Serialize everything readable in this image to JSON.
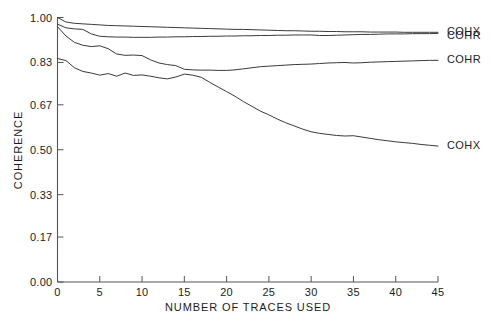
{
  "chart_data": {
    "type": "line",
    "title": "",
    "xlabel": "NUMBER OF TRACES USED",
    "ylabel": "COHERENCE",
    "xlim": [
      0,
      45
    ],
    "ylim": [
      0.0,
      1.0
    ],
    "grid": false,
    "legend_position": "right-inline",
    "xticks": [
      0,
      5,
      10,
      15,
      20,
      25,
      30,
      35,
      40,
      45
    ],
    "xticklabels": [
      "0",
      "5",
      "10",
      "15",
      "20",
      "25",
      "30",
      "35",
      "40",
      "45"
    ],
    "yticks": [
      0.0,
      0.17,
      0.33,
      0.5,
      0.67,
      0.83,
      1.0
    ],
    "yticklabels": [
      "0.00",
      "0.17",
      "0.33",
      "0.50",
      "0.67",
      "0.83",
      "1.00"
    ],
    "x": [
      0,
      1,
      2,
      3,
      4,
      5,
      6,
      7,
      8,
      9,
      10,
      11,
      12,
      13,
      14,
      15,
      16,
      17,
      18,
      19,
      20,
      21,
      22,
      23,
      24,
      25,
      26,
      27,
      28,
      29,
      30,
      31,
      32,
      33,
      34,
      35,
      36,
      37,
      38,
      39,
      40,
      41,
      42,
      43,
      44,
      45
    ],
    "series": [
      {
        "name": "COHX",
        "label": "COHX",
        "label_value": 0.945,
        "color": "#3a3a3a",
        "values": [
          1.0,
          0.983,
          0.978,
          0.976,
          0.974,
          0.972,
          0.97,
          0.969,
          0.968,
          0.967,
          0.966,
          0.965,
          0.964,
          0.963,
          0.962,
          0.961,
          0.96,
          0.959,
          0.958,
          0.957,
          0.956,
          0.955,
          0.955,
          0.954,
          0.953,
          0.952,
          0.951,
          0.95,
          0.95,
          0.949,
          0.948,
          0.948,
          0.947,
          0.947,
          0.946,
          0.946,
          0.946,
          0.945,
          0.945,
          0.945,
          0.945,
          0.944,
          0.944,
          0.944,
          0.944,
          0.944
        ]
      },
      {
        "name": "COHR",
        "label": "COHR",
        "label_value": 0.928,
        "color": "#3a3a3a",
        "values": [
          0.975,
          0.961,
          0.957,
          0.955,
          0.938,
          0.929,
          0.927,
          0.926,
          0.926,
          0.925,
          0.925,
          0.925,
          0.926,
          0.926,
          0.927,
          0.927,
          0.928,
          0.928,
          0.929,
          0.929,
          0.93,
          0.93,
          0.931,
          0.931,
          0.932,
          0.932,
          0.933,
          0.933,
          0.934,
          0.934,
          0.934,
          0.932,
          0.932,
          0.933,
          0.934,
          0.935,
          0.936,
          0.936,
          0.937,
          0.938,
          0.938,
          0.938,
          0.939,
          0.939,
          0.939,
          0.94
        ]
      },
      {
        "name": "COHR",
        "label": "COHR",
        "label_value": 0.838,
        "color": "#3a3a3a",
        "values": [
          0.965,
          0.93,
          0.906,
          0.895,
          0.89,
          0.893,
          0.882,
          0.862,
          0.857,
          0.858,
          0.856,
          0.84,
          0.828,
          0.822,
          0.818,
          0.804,
          0.802,
          0.801,
          0.801,
          0.8,
          0.8,
          0.802,
          0.806,
          0.81,
          0.814,
          0.816,
          0.818,
          0.82,
          0.822,
          0.823,
          0.824,
          0.826,
          0.828,
          0.829,
          0.83,
          0.828,
          0.829,
          0.831,
          0.832,
          0.833,
          0.834,
          0.835,
          0.836,
          0.837,
          0.838,
          0.838
        ]
      },
      {
        "name": "COHX",
        "label": "COHX",
        "label_value": 0.512,
        "color": "#3a3a3a",
        "values": [
          0.845,
          0.837,
          0.81,
          0.796,
          0.79,
          0.782,
          0.788,
          0.778,
          0.79,
          0.781,
          0.783,
          0.778,
          0.772,
          0.768,
          0.775,
          0.786,
          0.782,
          0.774,
          0.755,
          0.737,
          0.72,
          0.702,
          0.682,
          0.664,
          0.646,
          0.632,
          0.616,
          0.602,
          0.59,
          0.578,
          0.568,
          0.562,
          0.558,
          0.554,
          0.552,
          0.553,
          0.548,
          0.543,
          0.538,
          0.534,
          0.53,
          0.527,
          0.524,
          0.52,
          0.517,
          0.514
        ]
      }
    ]
  }
}
